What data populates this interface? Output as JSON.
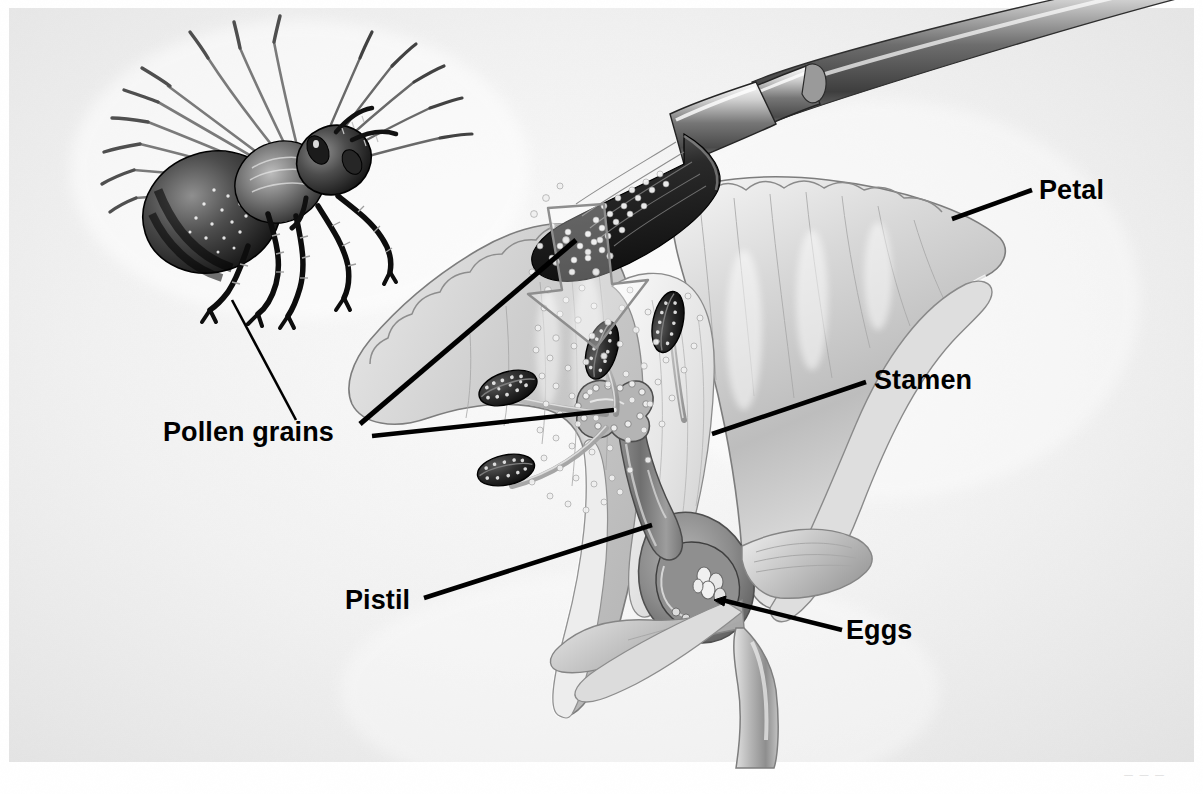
{
  "figure": {
    "kind": "labeled-botanical-illustration",
    "style": "grayscale pencil / airbrush rendering",
    "background_color": "#f2f2f2",
    "ink_color": "#000000",
    "credit_mark": "— — —"
  },
  "labels": [
    {
      "id": "pollen-grains",
      "text": "Pollen grains",
      "x": 163,
      "y": 419
    },
    {
      "id": "petal",
      "text": "Petal",
      "x": 1039,
      "y": 177
    },
    {
      "id": "stamen",
      "text": "Stamen",
      "x": 874,
      "y": 367
    },
    {
      "id": "pistil",
      "text": "Pistil",
      "x": 345,
      "y": 587
    },
    {
      "id": "eggs",
      "text": "Eggs",
      "x": 846,
      "y": 617
    }
  ],
  "leader_lines": [
    {
      "id": "bee-to-pollen",
      "from": [
        232,
        300
      ],
      "to": [
        296,
        420
      ]
    },
    {
      "id": "pollen-to-brush",
      "from": [
        360,
        424
      ],
      "to": [
        576,
        240
      ]
    },
    {
      "id": "pollen-to-anther",
      "from": [
        372,
        435
      ],
      "to": [
        612,
        410
      ]
    },
    {
      "id": "petal-leader",
      "from": [
        1032,
        190
      ],
      "to": [
        954,
        218
      ]
    },
    {
      "id": "stamen-leader",
      "from": [
        866,
        381
      ],
      "to": [
        712,
        434
      ]
    },
    {
      "id": "pistil-leader",
      "from": [
        424,
        597
      ],
      "to": [
        652,
        525
      ]
    },
    {
      "id": "eggs-leader",
      "from": [
        842,
        629
      ],
      "to": [
        722,
        600
      ]
    }
  ],
  "parts": [
    {
      "id": "honeybee",
      "name": "Honeybee"
    },
    {
      "id": "paintbrush",
      "name": "Paintbrush"
    },
    {
      "id": "pollen-cloud",
      "name": "Pollen grains falling from brush"
    },
    {
      "id": "arrow",
      "name": "Downward outline arrow"
    },
    {
      "id": "petal-left",
      "name": "Left petal (cut edge)"
    },
    {
      "id": "petal-right",
      "name": "Right petal"
    },
    {
      "id": "anthers",
      "name": "Anthers",
      "count": 4
    },
    {
      "id": "filaments",
      "name": "Filaments",
      "count": 4
    },
    {
      "id": "stigma",
      "name": "Stigma"
    },
    {
      "id": "style",
      "name": "Style"
    },
    {
      "id": "ovary",
      "name": "Ovary"
    },
    {
      "id": "ovules",
      "name": "Ovules / eggs"
    },
    {
      "id": "sepals",
      "name": "Sepals"
    },
    {
      "id": "stem",
      "name": "Stem"
    }
  ]
}
